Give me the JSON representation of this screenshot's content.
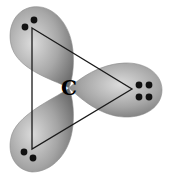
{
  "diagram": {
    "center_atom": {
      "label": "C",
      "x": 69,
      "y": 88
    },
    "lobes": [
      {
        "name": "lobe-upper-left",
        "angle_deg": 239,
        "electron_dots": 2
      },
      {
        "name": "lobe-right",
        "angle_deg": 0,
        "electron_dots": 4
      },
      {
        "name": "lobe-lower-left",
        "angle_deg": 121,
        "electron_dots": 2
      }
    ],
    "triangle_vertices": [
      {
        "x": 32,
        "y": 28
      },
      {
        "x": 132,
        "y": 89
      },
      {
        "x": 32,
        "y": 149
      }
    ],
    "colors": {
      "background": "#ffffff",
      "lobe_light": "#d4d4d4",
      "lobe_mid": "#9a9a9a",
      "lobe_dark": "#6e6e6e",
      "line": "#1a1a1a",
      "dot": "#111111",
      "label": "#000000"
    }
  }
}
